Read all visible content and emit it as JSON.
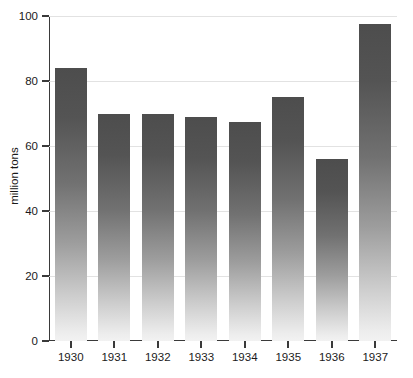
{
  "chart_data": {
    "type": "bar",
    "title": "",
    "subtitle": "",
    "xlabel": "",
    "ylabel": "million tons",
    "categories": [
      "1930",
      "1931",
      "1932",
      "1933",
      "1934",
      "1935",
      "1936",
      "1937"
    ],
    "values": [
      84,
      70,
      70,
      69,
      67.5,
      75,
      56,
      97.5
    ],
    "ylim": [
      0,
      100
    ],
    "yticks": [
      0,
      20,
      40,
      60,
      80,
      100
    ],
    "ytick_labels": [
      "0",
      "20",
      "40",
      "60",
      "80",
      "100"
    ],
    "grid": true,
    "grid_axis": "y",
    "legend": false,
    "legend_position": "none",
    "bar_fill": "vertical-gradient",
    "bar_color_top": "#4d4d4d",
    "bar_color_bottom": "#f2f2f2",
    "axis_color": "#3a3a3a",
    "gridline_color": "#e2e2e2",
    "background": "#ffffff"
  },
  "axes": {
    "y_title": "million tons"
  }
}
